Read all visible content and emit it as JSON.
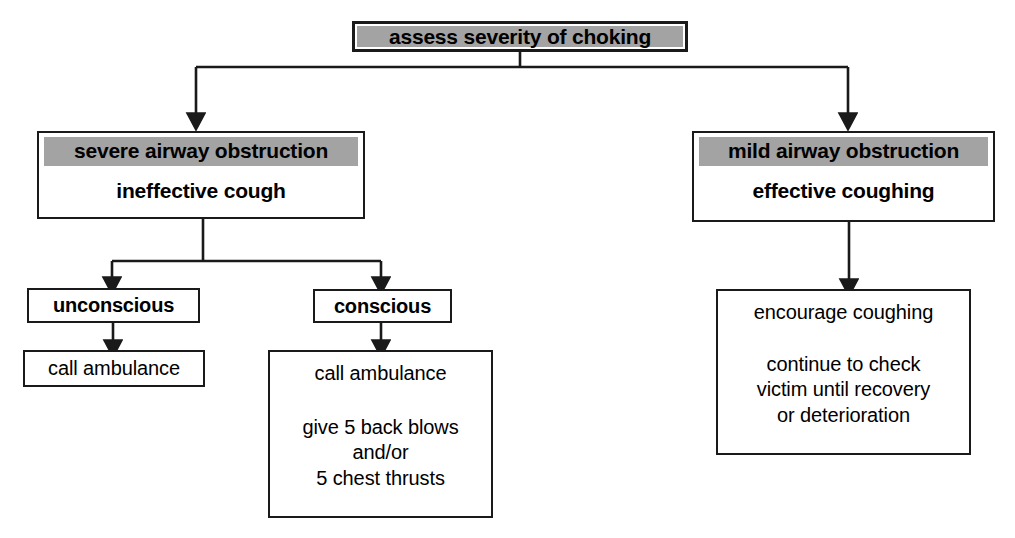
{
  "diagram": {
    "title_node": {
      "label": "assess severity of choking"
    },
    "branches": {
      "severe": {
        "header": "severe airway obstruction",
        "subtitle": "ineffective cough",
        "children": {
          "unconscious": {
            "label": "unconscious",
            "action": "call ambulance"
          },
          "conscious": {
            "label": "conscious",
            "action_lines": [
              "call ambulance",
              "give 5 back blows",
              "and/or",
              "5 chest thrusts"
            ]
          }
        }
      },
      "mild": {
        "header": "mild airway obstruction",
        "subtitle": "effective coughing",
        "action_lines": [
          "encourage coughing",
          "continue to check",
          "victim until recovery",
          "or deterioration"
        ]
      }
    },
    "colors": {
      "highlight": "#a3a3a3",
      "stroke": "#1a1a1a",
      "background": "#ffffff"
    },
    "bottom_caption": ""
  }
}
